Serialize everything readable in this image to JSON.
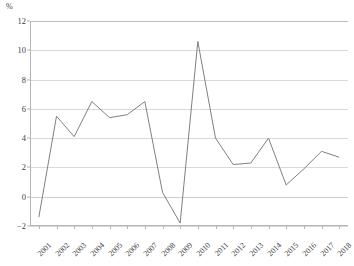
{
  "chart_data": {
    "type": "line",
    "title": "",
    "subtitle": "",
    "unit_label": "%",
    "xlabel": "",
    "ylabel": "",
    "ylim": [
      -2,
      12
    ],
    "ytick_step": 2,
    "yticks": [
      12,
      10,
      8,
      6,
      4,
      2,
      0,
      -2
    ],
    "ytick_labels": [
      "12",
      "10",
      "8",
      "6",
      "4",
      "2",
      "0",
      "−2"
    ],
    "grid": true,
    "grid_axis": "y",
    "legend": false,
    "legend_position": "none",
    "line_color": "#808080",
    "grid_color": "#d9d9d9",
    "axis_color": "#b4b4b4",
    "categories": [
      "2001",
      "2002",
      "2003",
      "2004",
      "2005",
      "2006",
      "2007",
      "2008",
      "2009",
      "2010",
      "2011",
      "2012",
      "2013",
      "2014",
      "2015",
      "2016",
      "2017",
      "2018"
    ],
    "xtick_labels": [
      "2001",
      "2002",
      "2003",
      "2004",
      "2005",
      "2006",
      "2007",
      "2008",
      "2009",
      "2010",
      "2011",
      "2012",
      "2013",
      "2014",
      "2015",
      "2016",
      "2017",
      "2018"
    ],
    "values": [
      -1.4,
      5.5,
      4.1,
      6.5,
      5.4,
      5.6,
      6.5,
      0.3,
      -1.8,
      10.6,
      4.0,
      2.2,
      2.3,
      4.0,
      0.8,
      1.9,
      3.1,
      2.7
    ],
    "series": [
      {
        "name": "series-1",
        "color": "#808080",
        "values": [
          -1.4,
          5.5,
          4.1,
          6.5,
          5.4,
          5.6,
          6.5,
          0.3,
          -1.8,
          10.6,
          4.0,
          2.2,
          2.3,
          4.0,
          0.8,
          1.9,
          3.1,
          2.7
        ]
      }
    ],
    "annotations": []
  }
}
